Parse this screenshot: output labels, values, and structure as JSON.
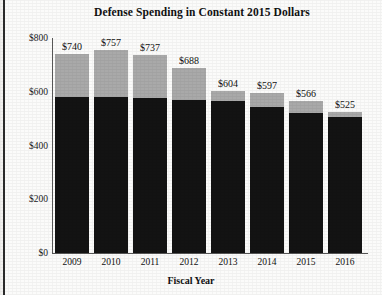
{
  "chart_data": {
    "type": "bar",
    "title": "Defense Spending in Constant 2015 Dollars",
    "xlabel": "Fiscal Year",
    "ylabel": "",
    "categories": [
      "2009",
      "2010",
      "2011",
      "2012",
      "2013",
      "2014",
      "2015",
      "2016"
    ],
    "values": [
      740,
      757,
      737,
      688,
      604,
      597,
      566,
      525
    ],
    "data_labels": [
      "$740",
      "$757",
      "$737",
      "$688",
      "$604",
      "$597",
      "$566",
      "$525"
    ],
    "series": [
      {
        "name": "base",
        "color": "#131313",
        "values": [
          580,
          580,
          578,
          570,
          565,
          545,
          520,
          505
        ]
      },
      {
        "name": "additional",
        "color": "#a9a9a9",
        "values": [
          160,
          177,
          159,
          118,
          39,
          52,
          46,
          20
        ]
      }
    ],
    "ylim": [
      0,
      800
    ],
    "yticks": [
      0,
      200,
      400,
      600,
      800
    ],
    "ytick_labels": [
      "$0",
      "$200",
      "$400",
      "$600",
      "$800"
    ],
    "grid": false,
    "legend": "none",
    "stacked": true
  },
  "colors": {
    "bar_dark": "#131313",
    "bar_light": "#a9a9a9",
    "axis": "#555555",
    "text": "#111111",
    "background": "#fbfbfa"
  }
}
